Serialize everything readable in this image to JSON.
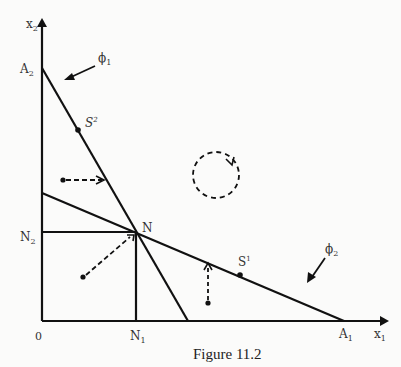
{
  "figure": {
    "caption": "Figure 11.2",
    "axes": {
      "x_label": "x",
      "x_sub": "1",
      "y_label": "x",
      "y_sub": "2",
      "origin_label": "0"
    },
    "points": {
      "A1": {
        "label": "A",
        "sub": "1"
      },
      "A2": {
        "label": "A",
        "sub": "2"
      },
      "N": {
        "label": "N"
      },
      "N1": {
        "label": "N",
        "sub": "1"
      },
      "N2": {
        "label": "N",
        "sub": "2"
      },
      "S1": {
        "label": "S",
        "sup": "1"
      },
      "S2": {
        "label": "S",
        "sup": "2"
      }
    },
    "curves": {
      "phi1": {
        "label": "ϕ",
        "sub": "1"
      },
      "phi2": {
        "label": "ϕ",
        "sub": "2"
      }
    },
    "colors": {
      "ink": "#111111",
      "background": "#fbfbfa"
    }
  }
}
